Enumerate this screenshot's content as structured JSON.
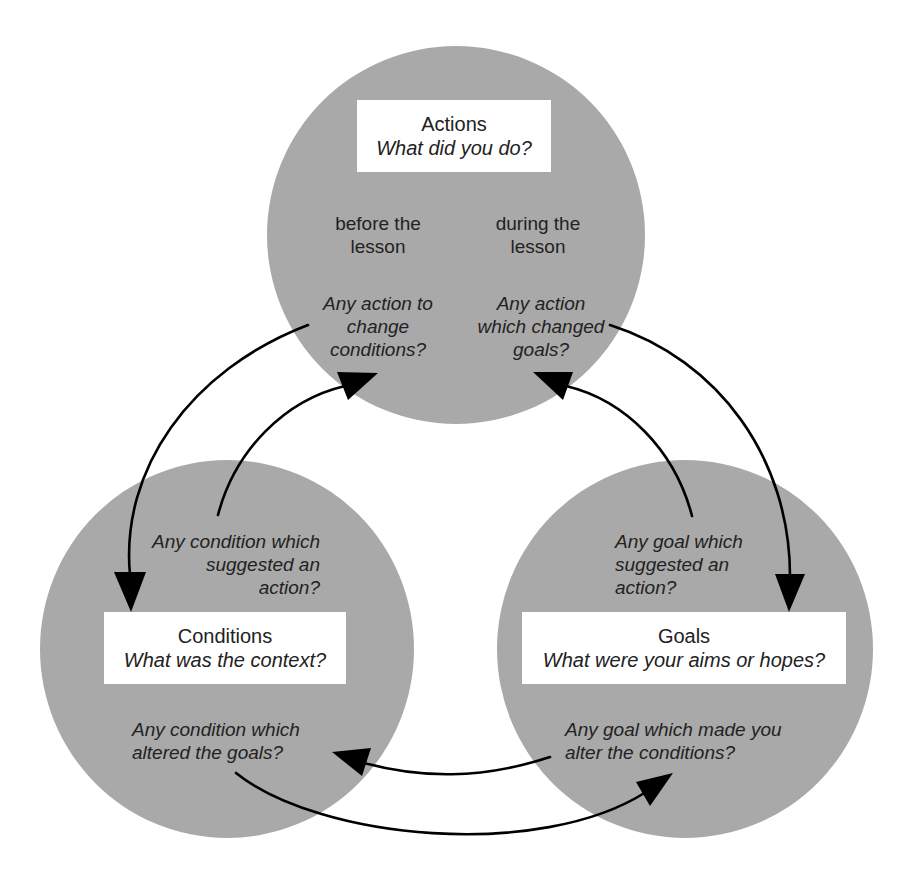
{
  "diagram": {
    "type": "cyclic-relationship",
    "colors": {
      "circle_fill": "#a9a9a9",
      "label_box": "#ffffff",
      "arrow": "#000000",
      "text": "#222222"
    },
    "nodes": {
      "actions": {
        "title": "Actions",
        "question": "What did you do?",
        "left_heading": "before the\nlesson",
        "right_heading": "during the\nlesson",
        "left_prompt": "Any action to\nchange\nconditions?",
        "right_prompt": "Any action\nwhich changed\ngoals?"
      },
      "conditions": {
        "title": "Conditions",
        "question": "What was the context?",
        "top_prompt": "Any condition which\nsuggested an\naction?",
        "bottom_prompt": "Any condition which\naltered the goals?"
      },
      "goals": {
        "title": "Goals",
        "question": "What were your aims or hopes?",
        "top_prompt": "Any goal which\nsuggested an\naction?",
        "bottom_prompt": "Any goal which made you\nalter the conditions?"
      }
    },
    "edges": [
      {
        "from": "actions",
        "to": "conditions",
        "label_ref": "actions.left_prompt"
      },
      {
        "from": "conditions",
        "to": "actions",
        "label_ref": "conditions.top_prompt"
      },
      {
        "from": "actions",
        "to": "goals",
        "label_ref": "actions.right_prompt"
      },
      {
        "from": "goals",
        "to": "actions",
        "label_ref": "goals.top_prompt"
      },
      {
        "from": "conditions",
        "to": "goals",
        "label_ref": "conditions.bottom_prompt"
      },
      {
        "from": "goals",
        "to": "conditions",
        "label_ref": "goals.bottom_prompt"
      }
    ]
  }
}
